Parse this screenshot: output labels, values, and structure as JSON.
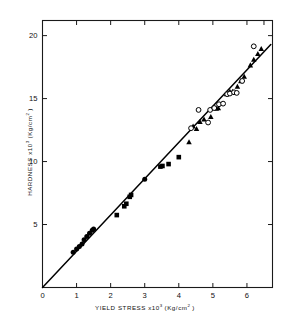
{
  "figure": {
    "title": "",
    "xlabel_main": "YIELD  STRESS  x10",
    "xlabel_exp": "3",
    "xlabel_units_pre": "  (Kg/cm",
    "xlabel_units_exp": "2",
    "xlabel_units_post": " )",
    "ylabel_main": "HARDNESS  x10",
    "ylabel_exp": "3",
    "ylabel_units_pre": "  (Kg/cm",
    "ylabel_units_exp": "2",
    "ylabel_units_post": " )",
    "xlabel_full": "YIELD STRESS x10^3 (Kg/cm^2)",
    "ylabel_full": "HARDNESS x10^3 (Kg/cm^2)"
  },
  "chart_data": {
    "type": "scatter",
    "title": "",
    "xlabel": "YIELD STRESS x10^3 (Kg/cm^2)",
    "ylabel": "HARDNESS x10^3 (Kg/cm^2)",
    "xlim": [
      0,
      6.75
    ],
    "ylim": [
      0,
      21.2
    ],
    "xticks": [
      0,
      1,
      2,
      3,
      4,
      5,
      6
    ],
    "xticklabels": [
      "0",
      "1",
      "2",
      "3",
      "4",
      "5",
      "6"
    ],
    "yticks": [
      5,
      10,
      15,
      20
    ],
    "yticklabels": [
      "5",
      "10",
      "15",
      "20"
    ],
    "grid": false,
    "legend": "none",
    "frame": "box",
    "tick_direction": "in",
    "marker_color": "#000000",
    "line_color": "#000000",
    "series": [
      {
        "name": "filled-circle",
        "marker": "circle-filled",
        "points": [
          [
            0.9,
            2.8
          ],
          [
            1.0,
            3.05
          ],
          [
            1.08,
            3.25
          ],
          [
            1.16,
            3.45
          ],
          [
            1.22,
            3.8
          ],
          [
            1.3,
            4.05
          ],
          [
            1.38,
            4.3
          ],
          [
            1.46,
            4.55
          ],
          [
            1.5,
            4.65
          ],
          [
            3.0,
            8.6
          ]
        ]
      },
      {
        "name": "filled-square",
        "marker": "square-filled",
        "points": [
          [
            2.18,
            5.75
          ],
          [
            2.4,
            6.45
          ],
          [
            2.46,
            6.65
          ],
          [
            2.56,
            7.2
          ],
          [
            2.6,
            7.35
          ],
          [
            3.46,
            9.6
          ],
          [
            3.52,
            9.65
          ],
          [
            3.7,
            9.8
          ],
          [
            4.0,
            10.35
          ]
        ]
      },
      {
        "name": "filled-triangle",
        "marker": "triangle-filled",
        "points": [
          [
            4.3,
            11.55
          ],
          [
            4.42,
            12.8
          ],
          [
            4.52,
            12.6
          ],
          [
            4.62,
            13.15
          ],
          [
            4.74,
            13.35
          ],
          [
            4.94,
            13.55
          ],
          [
            5.1,
            14.2
          ],
          [
            5.16,
            14.25
          ],
          [
            5.4,
            15.35
          ],
          [
            5.5,
            15.55
          ],
          [
            5.58,
            15.55
          ],
          [
            5.72,
            15.95
          ],
          [
            5.82,
            16.4
          ],
          [
            5.92,
            16.75
          ],
          [
            6.1,
            17.65
          ],
          [
            6.2,
            18.1
          ],
          [
            6.32,
            18.55
          ],
          [
            6.42,
            18.95
          ]
        ]
      },
      {
        "name": "open-circle",
        "marker": "circle-open",
        "points": [
          [
            4.36,
            12.65
          ],
          [
            4.58,
            14.1
          ],
          [
            4.86,
            13.1
          ],
          [
            4.92,
            14.1
          ],
          [
            5.04,
            14.25
          ],
          [
            5.18,
            14.55
          ],
          [
            5.3,
            14.6
          ],
          [
            5.42,
            15.35
          ],
          [
            5.5,
            15.4
          ],
          [
            5.62,
            15.5
          ],
          [
            5.7,
            15.45
          ],
          [
            5.86,
            16.4
          ],
          [
            6.2,
            19.15
          ]
        ]
      }
    ],
    "fit_line": {
      "name": "regression-line",
      "x0": 0.0,
      "y0": 0.0,
      "x1": 6.7,
      "y1": 19.3,
      "slope": 2.88,
      "intercept": 0.0
    }
  }
}
